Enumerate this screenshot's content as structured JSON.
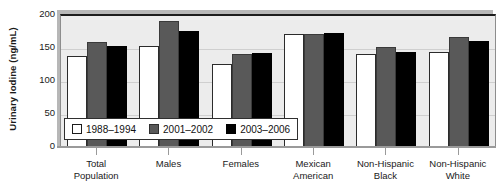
{
  "chart_data": {
    "type": "bar",
    "title": "",
    "xlabel": "",
    "ylabel": "Urinary Iodine (ng/mL)",
    "ylim": [
      0,
      200
    ],
    "yticks": [
      0,
      50,
      100,
      150,
      200
    ],
    "ytick_labels": [
      "0",
      "50",
      "100",
      "150",
      "200"
    ],
    "grid": true,
    "legend_position": "inside-bottom-left",
    "categories": [
      "Total Population",
      "Males",
      "Females",
      "Mexican American",
      "Non-Hispanic Black",
      "Non-Hispanic White"
    ],
    "category_lines": [
      [
        "Total",
        "Population"
      ],
      [
        "Males"
      ],
      [
        "Females"
      ],
      [
        "Mexican",
        "American"
      ],
      [
        "Non-Hispanic",
        "Black"
      ],
      [
        "Non-Hispanic",
        "White"
      ]
    ],
    "series": [
      {
        "name": "1988–1994",
        "color": "#ffffff",
        "values": [
          140,
          155,
          127,
          172,
          142,
          145
        ]
      },
      {
        "name": "2001–2002",
        "color": "#595959",
        "values": [
          160,
          192,
          142,
          173,
          153,
          168
        ]
      },
      {
        "name": "2003–2006",
        "color": "#000000",
        "values": [
          155,
          177,
          144,
          175,
          145,
          162
        ]
      }
    ]
  },
  "legend": {
    "items": [
      {
        "label": "1988–1994",
        "swatch": "white-square-icon"
      },
      {
        "label": "2001–2002",
        "swatch": "gray-square-icon"
      },
      {
        "label": "2003–2006",
        "swatch": "black-square-icon"
      }
    ]
  }
}
